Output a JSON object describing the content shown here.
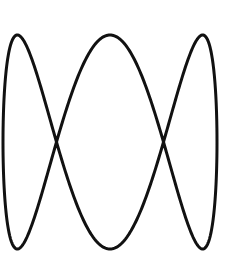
{
  "figure": {
    "type": "lissajous-curve",
    "background": "#ffffff",
    "stroke_color": "#111111",
    "stroke_width": 3,
    "parametric": {
      "cx": 110,
      "cy": 142,
      "ax": 107,
      "ay": 107,
      "x_freq": 1,
      "y_freq": 3,
      "samples": 600
    },
    "key_points": {
      "top_peaks": [
        [
          17,
          36
        ],
        [
          110,
          35
        ],
        [
          203,
          35
        ]
      ],
      "bottom_troughs": [
        [
          17,
          249
        ],
        [
          110,
          249
        ],
        [
          203,
          249
        ]
      ],
      "crossings": [
        [
          57,
          142
        ],
        [
          163,
          142
        ]
      ]
    }
  }
}
